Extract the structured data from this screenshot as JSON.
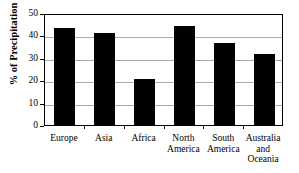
{
  "chart_data": {
    "type": "bar",
    "title": "",
    "xlabel": "",
    "ylabel": "% of Precipitation",
    "categories": [
      "Europe",
      "Asia",
      "Africa",
      "North America",
      "South America",
      "Australia and Oceania"
    ],
    "category_lines": [
      [
        "Europe"
      ],
      [
        "Asia"
      ],
      [
        "Africa"
      ],
      [
        "North",
        "America"
      ],
      [
        "South",
        "America"
      ],
      [
        "Australia",
        "and",
        "Oceania"
      ]
    ],
    "values": [
      43.5,
      41.0,
      20.5,
      44.0,
      36.5,
      31.5
    ],
    "ylim": [
      0,
      50
    ],
    "ytick_labels": [
      "0",
      "10",
      "20",
      "30",
      "40",
      "50"
    ],
    "ytick_values": [
      0,
      10,
      20,
      30,
      40,
      50
    ],
    "grid": true,
    "legend": "none",
    "bar_color": "#000000",
    "grid_color": "#aaaaaa",
    "axis_color": "#000000"
  }
}
